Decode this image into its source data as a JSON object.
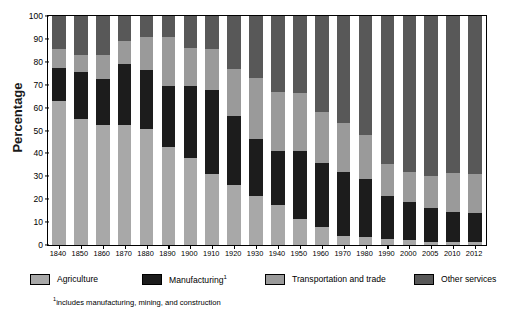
{
  "chart_data": {
    "type": "bar",
    "subtype": "stacked-100-percent",
    "title": "",
    "xlabel": "",
    "ylabel": "Percentage",
    "ylim": [
      0,
      100
    ],
    "yticks": [
      0,
      10,
      20,
      30,
      40,
      50,
      60,
      70,
      80,
      90,
      100
    ],
    "grid": false,
    "legend_position": "bottom",
    "footnote": "includes manufacturing, mining, and construction",
    "footnote_marker": "1",
    "categories": [
      "1840",
      "1850",
      "1860",
      "1870",
      "1880",
      "1890",
      "1900",
      "1910",
      "1920",
      "1930",
      "1940",
      "1950",
      "1960",
      "1970",
      "1980",
      "1990",
      "2000",
      "2005",
      "2010",
      "2012"
    ],
    "series": [
      {
        "name": "Agriculture",
        "color": "#a8a8a8",
        "values": [
          63,
          55,
          52.5,
          52.5,
          50.5,
          43,
          38,
          31,
          26,
          21.5,
          17.5,
          11.5,
          8,
          4,
          3.5,
          2.5,
          2,
          1.5,
          1.5,
          1.5
        ]
      },
      {
        "name": "Manufacturing",
        "legend_label": "Manufacturing",
        "legend_superscript": "1",
        "color": "#1c1c1c",
        "values": [
          14.5,
          20.5,
          20,
          26.5,
          26,
          26.5,
          31.5,
          36.5,
          30.5,
          25,
          23.5,
          29.5,
          28,
          28,
          25.5,
          19,
          17,
          14.5,
          13,
          12.5
        ]
      },
      {
        "name": "Transportation and trade",
        "color": "#9a9a9a",
        "values": [
          8,
          7.5,
          10.5,
          10,
          14.5,
          21.5,
          16.5,
          18,
          20.5,
          26.5,
          26,
          25.5,
          22,
          21.5,
          19,
          14,
          13,
          14,
          17,
          17
        ]
      },
      {
        "name": "Other services",
        "color": "#585858",
        "values": [
          14.5,
          17,
          17,
          11,
          9,
          9,
          14,
          14.5,
          23,
          27,
          33,
          33.5,
          42,
          46.5,
          52,
          64.5,
          68,
          70,
          68.5,
          69
        ]
      }
    ]
  },
  "legend": {
    "items": [
      {
        "label": "Agriculture",
        "sup": "",
        "color": "#a8a8a8",
        "left": 0
      },
      {
        "label": "Manufacturing",
        "sup": "1",
        "color": "#1c1c1c",
        "left": 112
      },
      {
        "label": "Transportation and trade",
        "sup": "",
        "color": "#9a9a9a",
        "left": 235
      },
      {
        "label": "Other services",
        "sup": "",
        "color": "#585858",
        "left": 384
      }
    ]
  }
}
